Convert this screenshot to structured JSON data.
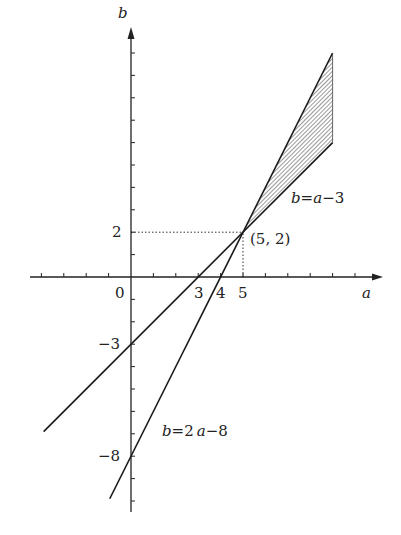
{
  "chart_data": {
    "type": "line",
    "title": "",
    "xlabel": "a",
    "ylabel": "b",
    "origin_label": "0",
    "xlim": [
      -4.5,
      11
    ],
    "ylim": [
      -10.5,
      11
    ],
    "grid": false,
    "x_ticks_every": 1,
    "y_ticks_every": 1,
    "x_tick_labels": [
      {
        "value": 3,
        "label": "3"
      },
      {
        "value": 4,
        "label": "4"
      },
      {
        "value": 5,
        "label": "5"
      }
    ],
    "y_tick_labels": [
      {
        "value": 2,
        "label": "2"
      },
      {
        "value": -3,
        "label": "−3"
      },
      {
        "value": -8,
        "label": "−8"
      }
    ],
    "series": [
      {
        "name": "b=a−3",
        "equation": "b = a - 3",
        "slope": 1,
        "intercept": -3,
        "x_range": [
          -3.9,
          9
        ]
      },
      {
        "name": "b=2a−8",
        "equation": "b = 2a - 8",
        "slope": 2,
        "intercept": -8,
        "x_range": [
          -0.95,
          9
        ]
      }
    ],
    "intersection": {
      "x": 5,
      "y": 2,
      "label": "(5, 2)"
    },
    "shaded_region": {
      "description": "region between b=2a-8 (upper) and b=a-3 (lower) for 5 <= a <= 9",
      "vertices": [
        [
          5,
          2
        ],
        [
          9,
          10
        ],
        [
          9,
          6
        ]
      ],
      "fill": "hatched"
    },
    "guide_lines": [
      {
        "from": [
          0,
          2
        ],
        "to": [
          5,
          2
        ],
        "style": "dotted"
      },
      {
        "from": [
          5,
          0
        ],
        "to": [
          5,
          2
        ],
        "style": "dotted"
      }
    ],
    "annotations": [
      {
        "text": "b=a−3",
        "near": [
          7.2,
          4.4
        ]
      },
      {
        "text": "b=2a−8",
        "near": [
          1.5,
          -7.6
        ]
      }
    ],
    "colors": {
      "line": "#1a1a1a",
      "axis": "#222222",
      "hatch": "#555555"
    }
  },
  "labels": {
    "axis_x": "a",
    "axis_y": "b",
    "origin": "0",
    "tick_3": "3",
    "tick_4": "4",
    "tick_5": "5",
    "tick_y2": "2",
    "tick_ym3": "−3",
    "tick_ym8": "−8",
    "point": "(5, 2)",
    "eq1_b": "b",
    "eq1_rest": "=",
    "eq1_a": "a",
    "eq1_tail": "−3",
    "eq2_b": "b",
    "eq2_mid": "=2 ",
    "eq2_a": "a",
    "eq2_tail": "−8"
  }
}
